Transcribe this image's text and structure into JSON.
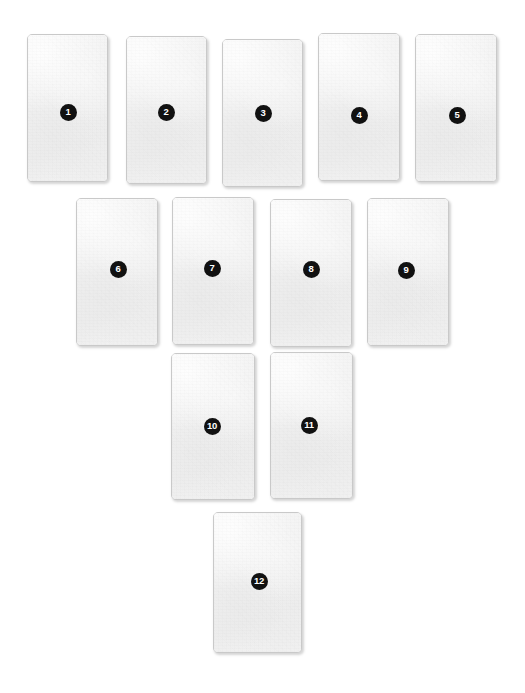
{
  "canvas": {
    "width": 525,
    "height": 693,
    "background_color": "#ffffff"
  },
  "style": {
    "card_fill_color": "#f1f1f1",
    "card_border_color": "#c9c9c9",
    "badge_fill_color": "#111111",
    "badge_text_color": "#ffffff",
    "card_corner_radius": 5
  },
  "layout": {
    "description": "pyramid",
    "rows": [
      5,
      4,
      2,
      1
    ],
    "total_cards": 12
  },
  "cards": [
    {
      "id": "card-1",
      "label": "1",
      "x": 27,
      "y": 34,
      "width": 81,
      "height": 148,
      "badge_x": 68,
      "badge_y": 112,
      "badge_size": 17,
      "badge_font_size": 9.5
    },
    {
      "id": "card-2",
      "label": "2",
      "x": 126,
      "y": 36,
      "width": 81,
      "height": 148,
      "badge_x": 166,
      "badge_y": 112,
      "badge_size": 17,
      "badge_font_size": 9.5
    },
    {
      "id": "card-3",
      "label": "3",
      "x": 222,
      "y": 39,
      "width": 81,
      "height": 148,
      "badge_x": 263,
      "badge_y": 113,
      "badge_size": 17,
      "badge_font_size": 9.5
    },
    {
      "id": "card-4",
      "label": "4",
      "x": 318,
      "y": 33,
      "width": 82,
      "height": 148,
      "badge_x": 359,
      "badge_y": 115,
      "badge_size": 17,
      "badge_font_size": 9.5
    },
    {
      "id": "card-5",
      "label": "5",
      "x": 415,
      "y": 34,
      "width": 82,
      "height": 148,
      "badge_x": 457,
      "badge_y": 115,
      "badge_size": 17,
      "badge_font_size": 9.5
    },
    {
      "id": "card-6",
      "label": "6",
      "x": 76,
      "y": 198,
      "width": 82,
      "height": 148,
      "badge_x": 118,
      "badge_y": 269,
      "badge_size": 17,
      "badge_font_size": 9.5
    },
    {
      "id": "card-7",
      "label": "7",
      "x": 172,
      "y": 197,
      "width": 82,
      "height": 148,
      "badge_x": 212,
      "badge_y": 268,
      "badge_size": 17,
      "badge_font_size": 9.5
    },
    {
      "id": "card-8",
      "label": "8",
      "x": 270,
      "y": 199,
      "width": 82,
      "height": 148,
      "badge_x": 311,
      "badge_y": 269,
      "badge_size": 17,
      "badge_font_size": 9.5
    },
    {
      "id": "card-9",
      "label": "9",
      "x": 367,
      "y": 198,
      "width": 82,
      "height": 148,
      "badge_x": 406,
      "badge_y": 270,
      "badge_size": 17,
      "badge_font_size": 9.5
    },
    {
      "id": "card-10",
      "label": "10",
      "x": 171,
      "y": 353,
      "width": 84,
      "height": 147,
      "badge_x": 212,
      "badge_y": 426,
      "badge_size": 17,
      "badge_font_size": 9.5
    },
    {
      "id": "card-11",
      "label": "11",
      "x": 270,
      "y": 352,
      "width": 83,
      "height": 147,
      "badge_x": 309,
      "badge_y": 425,
      "badge_size": 17,
      "badge_font_size": 9.5
    },
    {
      "id": "card-12",
      "label": "12",
      "x": 213,
      "y": 512,
      "width": 89,
      "height": 141,
      "badge_x": 259,
      "badge_y": 581,
      "badge_size": 17,
      "badge_font_size": 9.5
    }
  ]
}
